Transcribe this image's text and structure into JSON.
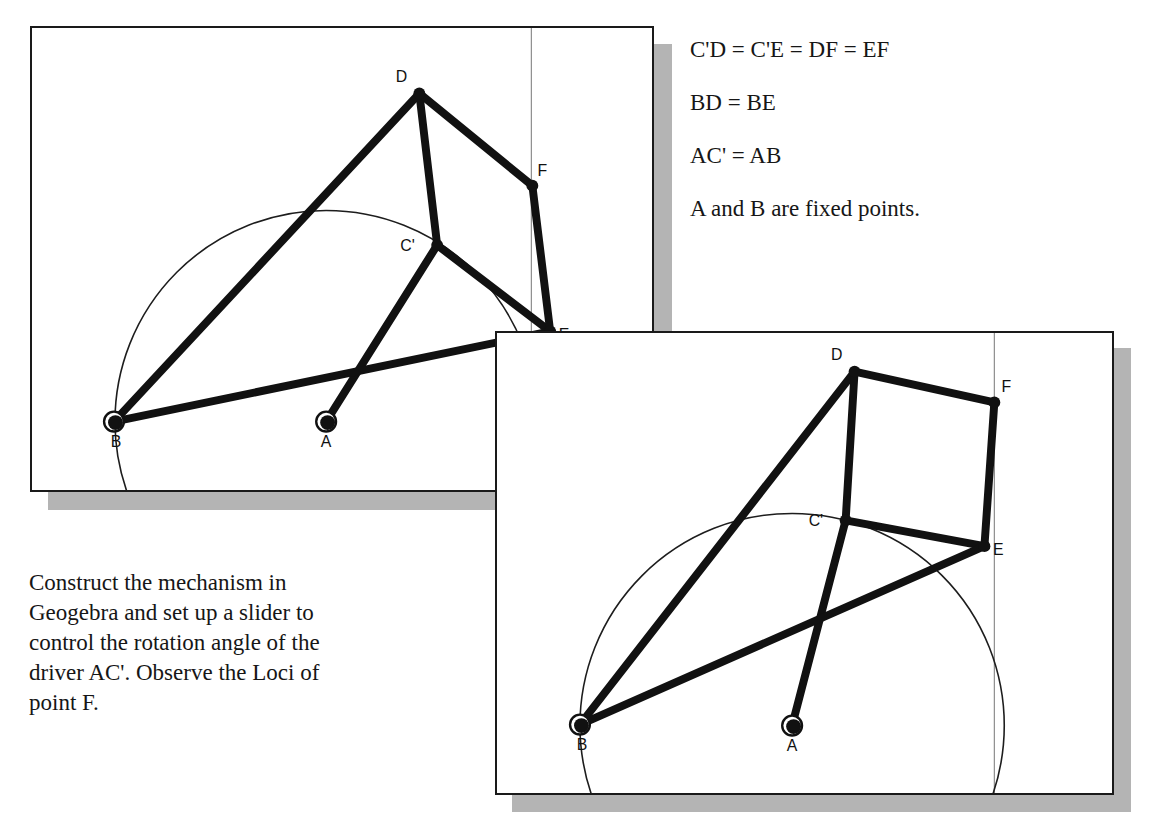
{
  "document": {
    "title": "Geogebra linkage mechanism exercise"
  },
  "equations": {
    "lines": [
      "C'D = C'E = DF = EF",
      "BD = BE",
      "AC' = AB",
      "A and B are fixed points."
    ]
  },
  "instruction": {
    "lines": [
      "Construct the mechanism in",
      "Geogebra and set up a slider to",
      "control the rotation angle of the",
      "driver AC'. Observe the Loci of",
      "point F."
    ]
  },
  "figures": [
    {
      "id": "figure-1",
      "name": "mechanism-pose-1",
      "frame": {
        "x": 30,
        "y": 26,
        "width": 624,
        "height": 466
      },
      "shadow_offset": 18,
      "guide_line_x": 503,
      "circle": {
        "cx": 296,
        "cy": 397,
        "r": 213
      },
      "points": [
        {
          "label": "D",
          "x": 390,
          "y": 66,
          "label_dx": -18,
          "label_dy": -12,
          "type": "joint"
        },
        {
          "label": "F",
          "x": 504,
          "y": 159,
          "label_dx": 10,
          "label_dy": -10,
          "type": "joint"
        },
        {
          "label": "C'",
          "x": 408,
          "y": 219,
          "label_dx": -30,
          "label_dy": 6,
          "type": "joint"
        },
        {
          "label": "E",
          "x": 522,
          "y": 306,
          "label_dx": 14,
          "label_dy": 9,
          "type": "joint"
        },
        {
          "label": "B",
          "x": 82,
          "y": 397,
          "label_dx": 2,
          "label_dy": 26,
          "type": "pivot"
        },
        {
          "label": "A",
          "x": 296,
          "y": 397,
          "label_dx": 0,
          "label_dy": 26,
          "type": "pivot"
        }
      ],
      "links": [
        [
          "B",
          "D"
        ],
        [
          "D",
          "C'"
        ],
        [
          "D",
          "F"
        ],
        [
          "C'",
          "E"
        ],
        [
          "F",
          "E"
        ],
        [
          "A",
          "C'"
        ],
        [
          "B",
          "E"
        ]
      ]
    },
    {
      "id": "figure-2",
      "name": "mechanism-pose-2",
      "frame": {
        "x": 495,
        "y": 331,
        "width": 619,
        "height": 464
      },
      "shadow_offset": 17,
      "guide_line_x": 501,
      "circle": {
        "cx": 297,
        "cy": 396,
        "r": 214
      },
      "points": [
        {
          "label": "D",
          "x": 360,
          "y": 39,
          "label_dx": -18,
          "label_dy": -12,
          "type": "joint"
        },
        {
          "label": "F",
          "x": 501,
          "y": 70,
          "label_dx": 12,
          "label_dy": -10,
          "type": "joint"
        },
        {
          "label": "C'",
          "x": 351,
          "y": 189,
          "label_dx": -30,
          "label_dy": 6,
          "type": "joint"
        },
        {
          "label": "E",
          "x": 491,
          "y": 215,
          "label_dx": 14,
          "label_dy": 9,
          "type": "joint"
        },
        {
          "label": "B",
          "x": 83,
          "y": 395,
          "label_dx": 2,
          "label_dy": 26,
          "type": "pivot"
        },
        {
          "label": "A",
          "x": 297,
          "y": 396,
          "label_dx": 0,
          "label_dy": 26,
          "type": "pivot"
        }
      ],
      "links": [
        [
          "B",
          "D"
        ],
        [
          "D",
          "C'"
        ],
        [
          "D",
          "F"
        ],
        [
          "C'",
          "E"
        ],
        [
          "F",
          "E"
        ],
        [
          "A",
          "C'"
        ],
        [
          "B",
          "E"
        ]
      ]
    }
  ],
  "colors": {
    "ink": "#111111",
    "paper": "#ffffff",
    "frame_border": "#1a1a1a",
    "shadow": "#b4b4b4",
    "guide": "#8c8c8c"
  }
}
